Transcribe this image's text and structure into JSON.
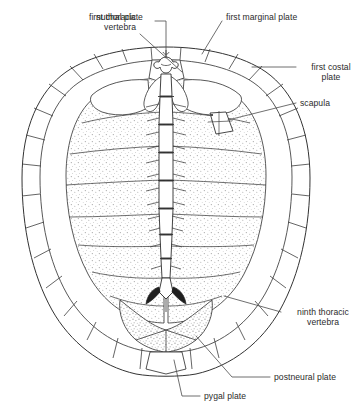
{
  "figure": {
    "view": "dorsal",
    "colors": {
      "background": "#ffffff",
      "ink": "#3a3a3a",
      "outline": "#333333",
      "text": "#2b2b2b",
      "stipple": "#8a8a8a",
      "leader": "#4a4a4a"
    },
    "canvas": {
      "width": 364,
      "height": 420
    },
    "shell_bounds": {
      "left": 22,
      "top": 47,
      "right": 310,
      "bottom": 376
    }
  },
  "labels": [
    {
      "id": "first-thoracic-vertebra",
      "lines": [
        "first thoracic",
        "vertebra"
      ],
      "text": "first thoracic vertebra",
      "align": "right",
      "x": 18,
      "y": 12,
      "width": 118,
      "leader": {
        "from": [
          140,
          34
        ],
        "to": [
          182,
          72
        ]
      }
    },
    {
      "id": "nuchal-plate",
      "lines": [
        "nuchal plate"
      ],
      "text": "nuchal plate",
      "align": "left",
      "x": 96,
      "y": 12,
      "width": 66,
      "leader": {
        "from": [
          155,
          21
        ],
        "to": [
          166,
          21
        ],
        "drop": [
          166,
          58
        ]
      }
    },
    {
      "id": "first-marginal-plate",
      "lines": [
        "first marginal plate"
      ],
      "text": "first marginal plate",
      "align": "left",
      "x": 226,
      "y": 12,
      "width": 104,
      "leader": {
        "from": [
          222,
          21
        ],
        "to": [
          202,
          54
        ]
      }
    },
    {
      "id": "first-costal-plate",
      "lines": [
        "first costal",
        "plate"
      ],
      "text": "first costal plate",
      "align": "left",
      "x": 300,
      "y": 62,
      "width": 62,
      "leader": {
        "from": [
          296,
          67
        ],
        "to": [
          252,
          67
        ]
      }
    },
    {
      "id": "scapula",
      "lines": [
        "scapula"
      ],
      "text": "scapula",
      "align": "left",
      "x": 300,
      "y": 98,
      "width": 52,
      "leader": {
        "from": [
          296,
          103
        ],
        "to": [
          228,
          120
        ]
      }
    },
    {
      "id": "ninth-thoracic-vertebra",
      "lines": [
        "ninth thoracic",
        "vertebra"
      ],
      "text": "ninth thoracic vertebra",
      "align": "left",
      "x": 284,
      "y": 307,
      "width": 78,
      "leader": {
        "from": [
          281,
          312
        ],
        "to": [
          224,
          296
        ]
      }
    },
    {
      "id": "postneural-plate",
      "lines": [
        "postneural plate"
      ],
      "text": "postneural plate",
      "align": "left",
      "x": 274,
      "y": 372,
      "width": 88,
      "leader": {
        "from": [
          270,
          377
        ],
        "to": [
          232,
          377
        ],
        "tail": [
          196,
          336
        ]
      }
    },
    {
      "id": "pygal-plate",
      "lines": [
        "pygal plate"
      ],
      "text": "pygal plate",
      "align": "left",
      "x": 204,
      "y": 392,
      "width": 62,
      "leader": {
        "from": [
          200,
          396
        ],
        "to": [
          182,
          396
        ],
        "tail": [
          174,
          360
        ]
      }
    }
  ],
  "anatomy": {
    "parts": [
      "nuchal plate",
      "first marginal plate",
      "first costal plate",
      "scapula",
      "first thoracic vertebra",
      "ninth thoracic vertebra",
      "postneural plate",
      "pygal plate",
      "neural plates",
      "costal plates",
      "marginal plates"
    ],
    "vertebral_column_segments": 9,
    "marginal_plates_visible": 24
  }
}
